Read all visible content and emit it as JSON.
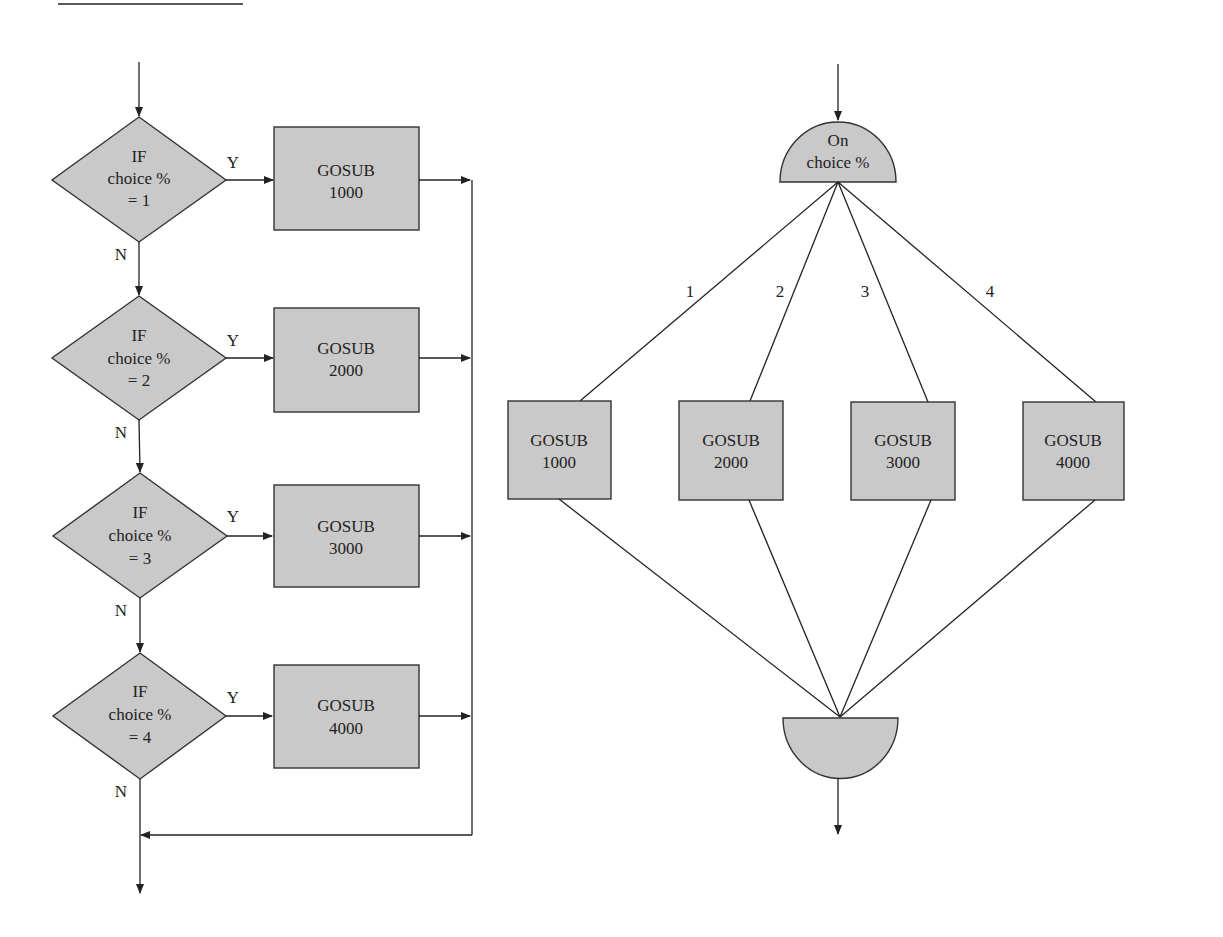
{
  "left_flowchart": {
    "decisions": [
      {
        "line1": "IF",
        "line2": "choice %",
        "line3": "= 1",
        "yes_label": "Y",
        "no_label": "N",
        "action_line1": "GOSUB",
        "action_line2": "1000"
      },
      {
        "line1": "IF",
        "line2": "choice %",
        "line3": "= 2",
        "yes_label": "Y",
        "no_label": "N",
        "action_line1": "GOSUB",
        "action_line2": "2000"
      },
      {
        "line1": "IF",
        "line2": "choice %",
        "line3": "= 3",
        "yes_label": "Y",
        "no_label": "N",
        "action_line1": "GOSUB",
        "action_line2": "3000"
      },
      {
        "line1": "IF",
        "line2": "choice %",
        "line3": "= 4",
        "yes_label": "Y",
        "no_label": "N",
        "action_line1": "GOSUB",
        "action_line2": "4000"
      }
    ]
  },
  "right_flowchart": {
    "switch_line1": "On",
    "switch_line2": "choice %",
    "branches": [
      {
        "label": "1",
        "action_line1": "GOSUB",
        "action_line2": "1000"
      },
      {
        "label": "2",
        "action_line1": "GOSUB",
        "action_line2": "2000"
      },
      {
        "label": "3",
        "action_line1": "GOSUB",
        "action_line2": "3000"
      },
      {
        "label": "4",
        "action_line1": "GOSUB",
        "action_line2": "4000"
      }
    ]
  },
  "colors": {
    "shape_fill": "#c9c9c9",
    "line": "#222222"
  }
}
